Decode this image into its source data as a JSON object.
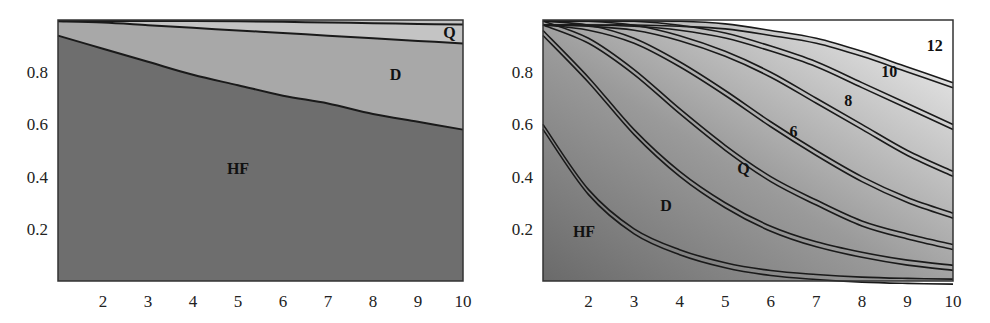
{
  "chart_data": [
    {
      "type": "area",
      "title": "",
      "xlabel": "",
      "ylabel": "",
      "xlim": [
        1,
        10
      ],
      "ylim": [
        0,
        1
      ],
      "grid": false,
      "x_ticks": [
        "2",
        "3",
        "4",
        "5",
        "6",
        "7",
        "8",
        "9",
        "10"
      ],
      "y_ticks": [
        "0.2",
        "0.4",
        "0.6",
        "0.8"
      ],
      "x": [
        1,
        2,
        3,
        4,
        5,
        6,
        7,
        8,
        9,
        10
      ],
      "series": [
        {
          "name": "HF",
          "values": [
            0.94,
            0.89,
            0.84,
            0.79,
            0.75,
            0.71,
            0.68,
            0.64,
            0.61,
            0.58
          ]
        },
        {
          "name": "D",
          "values": [
            0.995,
            0.99,
            0.98,
            0.97,
            0.96,
            0.95,
            0.94,
            0.93,
            0.92,
            0.91
          ]
        },
        {
          "name": "Q",
          "values": [
            1.0,
            1.0,
            1.0,
            0.997,
            0.995,
            0.993,
            0.99,
            0.988,
            0.985,
            0.983
          ]
        }
      ],
      "region_labels": [
        {
          "text": "HF",
          "x": 5.0,
          "y": 0.41
        },
        {
          "text": "D",
          "x": 8.5,
          "y": 0.77
        },
        {
          "text": "Q",
          "x": 9.7,
          "y": 0.93
        }
      ],
      "fill_colors": {
        "HF": "#6e6e6e",
        "D": "#a8a8a8",
        "Q": "#c4c4c4"
      }
    },
    {
      "type": "line",
      "title": "",
      "xlabel": "",
      "ylabel": "",
      "xlim": [
        1,
        10
      ],
      "ylim": [
        0,
        1
      ],
      "grid": false,
      "x_ticks": [
        "2",
        "3",
        "4",
        "5",
        "6",
        "7",
        "8",
        "9",
        "10"
      ],
      "y_ticks": [
        "0.2",
        "0.4",
        "0.6",
        "0.8"
      ],
      "x": [
        1,
        2,
        3,
        4,
        5,
        6,
        7,
        8,
        9,
        10
      ],
      "series": [
        {
          "name": "HF",
          "values": [
            0.6,
            0.35,
            0.2,
            0.12,
            0.07,
            0.04,
            0.025,
            0.015,
            0.01,
            0.007
          ]
        },
        {
          "name": "D",
          "values": [
            0.96,
            0.78,
            0.58,
            0.42,
            0.3,
            0.21,
            0.15,
            0.11,
            0.08,
            0.06
          ]
        },
        {
          "name": "Q",
          "values": [
            1.0,
            0.93,
            0.81,
            0.66,
            0.52,
            0.4,
            0.31,
            0.23,
            0.18,
            0.14
          ]
        },
        {
          "name": "6",
          "values": [
            1.0,
            0.98,
            0.93,
            0.84,
            0.73,
            0.61,
            0.5,
            0.4,
            0.32,
            0.26
          ]
        },
        {
          "name": "8",
          "values": [
            1.0,
            0.995,
            0.98,
            0.94,
            0.88,
            0.8,
            0.7,
            0.6,
            0.5,
            0.42
          ]
        },
        {
          "name": "10",
          "values": [
            1.0,
            1.0,
            0.995,
            0.98,
            0.95,
            0.9,
            0.84,
            0.76,
            0.68,
            0.6
          ]
        },
        {
          "name": "12",
          "values": [
            1.0,
            1.0,
            1.0,
            0.995,
            0.985,
            0.96,
            0.93,
            0.88,
            0.82,
            0.76
          ]
        }
      ],
      "region_labels": [
        {
          "text": "HF",
          "x": 1.9,
          "y": 0.17
        },
        {
          "text": "D",
          "x": 3.7,
          "y": 0.27
        },
        {
          "text": "Q",
          "x": 5.4,
          "y": 0.41
        },
        {
          "text": "6",
          "x": 6.5,
          "y": 0.55
        },
        {
          "text": "8",
          "x": 7.7,
          "y": 0.67
        },
        {
          "text": "10",
          "x": 8.6,
          "y": 0.78
        },
        {
          "text": "12",
          "x": 9.6,
          "y": 0.88
        }
      ]
    }
  ]
}
